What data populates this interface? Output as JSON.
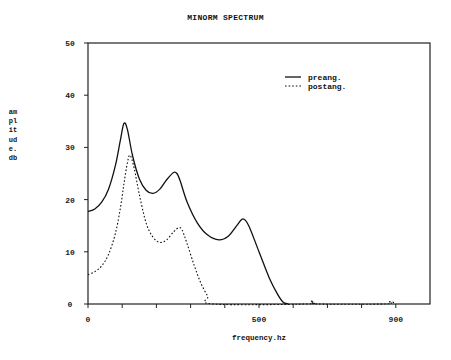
{
  "chart_data": {
    "type": "line",
    "title": "MINORM SPECTRUM",
    "xlabel": "frequency.hz",
    "ylabel": "amplitude.db",
    "xlim": [
      0,
      1000
    ],
    "ylim": [
      0,
      50
    ],
    "x_ticks": [
      0,
      100,
      200,
      300,
      400,
      500,
      600,
      700,
      800,
      900
    ],
    "x_tick_labels": [
      "0",
      "500",
      "900"
    ],
    "x_tick_label_positions": [
      0,
      500,
      900
    ],
    "y_ticks": [
      0,
      10,
      20,
      30,
      40,
      50
    ],
    "y_tick_labels": [
      "0",
      "10",
      "20",
      "30",
      "40",
      "50"
    ],
    "grid": false,
    "legend_position": "upper right",
    "series": [
      {
        "name": "preang.",
        "style": "solid",
        "x": [
          0,
          20,
          40,
          60,
          80,
          95,
          105,
          115,
          130,
          150,
          170,
          190,
          210,
          230,
          250,
          260,
          270,
          290,
          320,
          350,
          383,
          410,
          435,
          453,
          470,
          500,
          530,
          555,
          570,
          585
        ],
        "y": [
          17.7,
          18.2,
          19.5,
          22.0,
          26.5,
          31.5,
          34.6,
          33.5,
          28.5,
          24.0,
          21.8,
          21.2,
          22.0,
          23.8,
          25.2,
          25.0,
          23.5,
          19.5,
          15.5,
          13.2,
          12.3,
          13.0,
          15.0,
          16.3,
          15.0,
          10.0,
          5.0,
          1.8,
          0.4,
          0
        ]
      },
      {
        "name": "postang.",
        "style": "dotted",
        "x": [
          0,
          20,
          40,
          60,
          80,
          95,
          105,
          115,
          123,
          135,
          150,
          170,
          190,
          210,
          230,
          250,
          265,
          275,
          290,
          310,
          330,
          350,
          365,
          640,
          650,
          660,
          670,
          870,
          880,
          890,
          900
        ],
        "y": [
          5.6,
          6.2,
          7.3,
          9.5,
          13.5,
          18.5,
          23.0,
          27.0,
          28.5,
          26.0,
          21.0,
          15.5,
          12.8,
          11.8,
          12.3,
          13.8,
          14.6,
          14.2,
          11.5,
          7.5,
          4.0,
          1.5,
          0,
          0,
          0.5,
          0.5,
          0,
          0,
          0.4,
          0.4,
          0
        ]
      }
    ]
  }
}
